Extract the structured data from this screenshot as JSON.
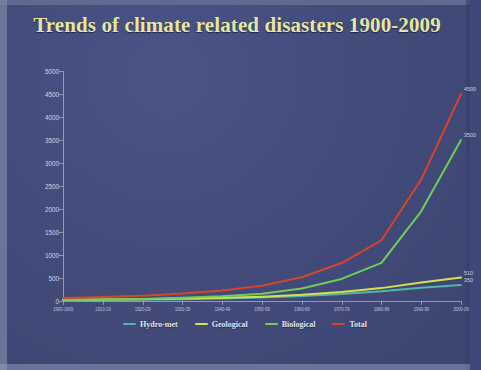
{
  "title": "Trends of climate related disasters 1900-2009",
  "colors": {
    "background": "#434c7c",
    "title": "#e9e9a6",
    "axis": "#aeb4cf",
    "hydro_met": "#4fb9a8",
    "geological": "#d7e34a",
    "biological": "#6fcf5a",
    "total": "#d8442a"
  },
  "legend": {
    "items": [
      {
        "label": "Hydro-met",
        "color": "#4fb9a8"
      },
      {
        "label": "Geological",
        "color": "#d7e34a"
      },
      {
        "label": "Biological",
        "color": "#6fcf5a"
      },
      {
        "label": "Total",
        "color": "#d8442a"
      }
    ]
  },
  "end_labels": [
    {
      "text": "4500",
      "series": "Total"
    },
    {
      "text": "3500",
      "series": "Biological"
    },
    {
      "text": "510",
      "series": "Geological"
    },
    {
      "text": "350",
      "series": "Hydro-met"
    }
  ],
  "chart_data": {
    "type": "line",
    "title": "Trends of climate related disasters 1900-2009",
    "xlabel": "",
    "ylabel": "",
    "ylim": [
      0,
      5000
    ],
    "ytick_step": 500,
    "yticks": [
      0,
      500,
      1000,
      1500,
      2000,
      2500,
      3000,
      3500,
      4000,
      4500,
      5000
    ],
    "grid": false,
    "legend_position": "bottom",
    "categories": [
      "1900-1909",
      "1910-19",
      "1920-29",
      "1930-39",
      "1940-49",
      "1950-59",
      "1960-69",
      "1970-79",
      "1980-89",
      "1990-99",
      "2000-09"
    ],
    "series": [
      {
        "name": "Hydro-met",
        "color": "#4fb9a8",
        "values": [
          20,
          25,
          30,
          40,
          55,
          75,
          110,
          150,
          210,
          290,
          350
        ]
      },
      {
        "name": "Geological",
        "color": "#d7e34a",
        "values": [
          25,
          30,
          40,
          55,
          70,
          95,
          135,
          195,
          280,
          400,
          510
        ]
      },
      {
        "name": "Biological",
        "color": "#6fcf5a",
        "values": [
          20,
          30,
          45,
          70,
          105,
          160,
          270,
          480,
          830,
          1950,
          3500
        ]
      },
      {
        "name": "Total",
        "color": "#d8442a",
        "values": [
          65,
          85,
          115,
          165,
          230,
          330,
          515,
          825,
          1320,
          2640,
          4500
        ]
      }
    ]
  }
}
